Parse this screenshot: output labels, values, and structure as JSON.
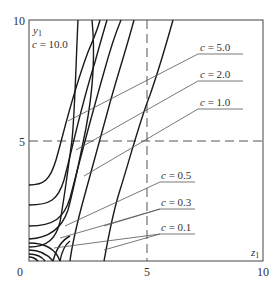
{
  "figure": {
    "x_axis": {
      "label": "z1",
      "label_main": "z",
      "label_sub": "1",
      "ticks": [
        "0",
        "5",
        "10"
      ],
      "range": [
        0,
        10
      ]
    },
    "y_axis": {
      "label": "y1",
      "label_main": "y",
      "label_sub": "1",
      "ticks": [
        "10",
        "5"
      ],
      "range": [
        0,
        10
      ]
    },
    "reference_lines": {
      "vertical_dashed_at_x": 5,
      "horizontal_dashed_at_y": 5
    },
    "curve_labels": [
      {
        "c_symbol": "c",
        "eq": " = ",
        "value": "10.0",
        "text": "c = 10.0"
      },
      {
        "c_symbol": "c",
        "eq": " = ",
        "value": "5.0",
        "text": "c = 5.0"
      },
      {
        "c_symbol": "c",
        "eq": " = ",
        "value": "2.0",
        "text": "c = 2.0"
      },
      {
        "c_symbol": "c",
        "eq": " = ",
        "value": "1.0",
        "text": "c = 1.0"
      },
      {
        "c_symbol": "c",
        "eq": " = ",
        "value": "0.5",
        "text": "c = 0.5"
      },
      {
        "c_symbol": "c",
        "eq": " = ",
        "value": "0.3",
        "text": "c = 0.3"
      },
      {
        "c_symbol": "c",
        "eq": " = ",
        "value": "0.1",
        "text": "c = 0.1"
      }
    ],
    "colors": {
      "curve": "#1a1a1a",
      "leader": "#555555",
      "frame": "#444444",
      "text": "#333333"
    }
  }
}
